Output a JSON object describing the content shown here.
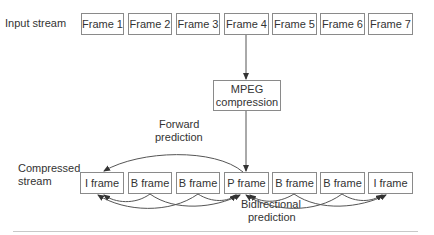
{
  "labels": {
    "input_stream": "Input stream",
    "compressed_stream_line1": "Compressed",
    "compressed_stream_line2": "stream",
    "forward_prediction_line1": "Forward",
    "forward_prediction_line2": "prediction",
    "bidirectional_prediction_line1": "Bidirectional",
    "bidirectional_prediction_line2": "prediction"
  },
  "input_frames": [
    "Frame 1",
    "Frame 2",
    "Frame 3",
    "Frame 4",
    "Frame 5",
    "Frame 6",
    "Frame 7"
  ],
  "compressor": {
    "line1": "MPEG",
    "line2": "compression"
  },
  "compressed_frames": [
    "I frame",
    "B frame",
    "B frame",
    "P frame",
    "B frame",
    "B frame",
    "I frame"
  ],
  "colors": {
    "border": "#8a8a8a",
    "arrow": "#444444",
    "text": "#333333"
  }
}
